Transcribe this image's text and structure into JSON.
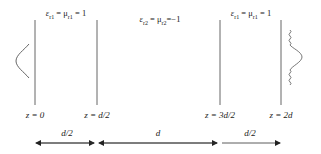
{
  "diagram": {
    "regions": [
      {
        "id": "region-1",
        "label": "ε_r1 = μ_r1 = 1",
        "x": 66
      },
      {
        "id": "region-2",
        "label": "ε_r2 = μ_r2 = −1",
        "x": 160
      },
      {
        "id": "region-3",
        "label": "ε_r1 = μ_r1 = 1",
        "x": 251
      }
    ],
    "boundaries": [
      {
        "label": "z = 0",
        "x": 35
      },
      {
        "label": "z = d/2",
        "x": 97
      },
      {
        "label": "z = 3d/2",
        "x": 220
      },
      {
        "label": "z = 2d",
        "x": 281
      }
    ],
    "dimensions": [
      {
        "label": "d/2",
        "x1": 35,
        "x2": 96
      },
      {
        "label": "d",
        "x1": 98,
        "x2": 219
      },
      {
        "label": "d/2",
        "x1": 221,
        "x2": 281
      }
    ],
    "labels": {
      "r1_left": "ε",
      "r1_left_sub": "r1",
      "eq1": " = μ",
      "r1_mu_sub": "r1",
      "eq_one": " = 1",
      "r2_eps": "ε",
      "r2_eps_sub": "r2",
      "r2_eq": " = μ",
      "r2_mu_sub": "r2",
      "r2_val": "=−1",
      "r3_eps": "ε",
      "r3_eps_sub": "r1",
      "r3_eq": " = μ",
      "r3_mu_sub": "r1",
      "r3_val": " = 1",
      "z0": "z = 0",
      "z1": "z = d/2",
      "z2": "z = 3d/2",
      "z3": "z = 2d",
      "dim1": "d/2",
      "dim2": "d",
      "dim3": "d/2"
    },
    "colors": {
      "line": "#555555",
      "text": "#222222"
    }
  }
}
